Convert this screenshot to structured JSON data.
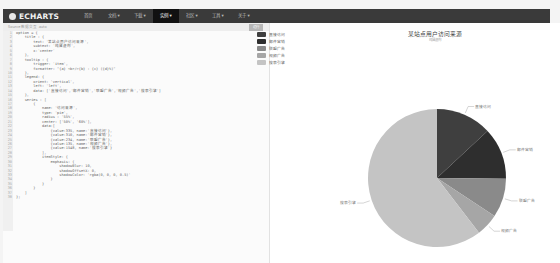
{
  "navbar": {
    "logo": "ECHARTS",
    "items": [
      {
        "label": "首页"
      },
      {
        "label": "文档 ▾"
      },
      {
        "label": "下载 ▾"
      },
      {
        "label": "实例 ▾",
        "active": true
      },
      {
        "label": "社区 ▾"
      },
      {
        "label": "工具 ▾"
      },
      {
        "label": "关于 ▾"
      }
    ]
  },
  "editor": {
    "header": "Source  数据交互  auto",
    "run_button": "运行",
    "lines": [
      "option = {",
      "    title : {",
      "        text: '某站点用户访问来源',",
      "        subtext: '纯属虚构',",
      "        x:'center'",
      "    },",
      "    tooltip : {",
      "        trigger: 'item',",
      "        formatter: \"{a} <br/>{b} : {c} ({d}%)\"",
      "    },",
      "    legend: {",
      "        orient: 'vertical',",
      "        left: 'left',",
      "        data: ['直接访问','邮件营销','联盟广告','视频广告','搜索引擎']",
      "    },",
      "    series : [",
      "        {",
      "            name: '访问来源',",
      "            type: 'pie',",
      "            radius : '55%',",
      "            center: ['50%', '60%'],",
      "            data:[",
      "                {value:335, name:'直接访问'},",
      "                {value:310, name:'邮件营销'},",
      "                {value:234, name:'联盟广告'},",
      "                {value:135, name:'视频广告'},",
      "                {value:1548, name:'搜索引擎'}",
      "            ],",
      "            itemStyle: {",
      "                emphasis: {",
      "                    shadowBlur: 10,",
      "                    shadowOffsetX: 0,",
      "                    shadowColor: 'rgba(0, 0, 0, 0.5)'",
      "                }",
      "            }",
      "        }",
      "    ]",
      "};"
    ]
  },
  "chart": {
    "title": "某站点用户访问来源",
    "subtitle": "纯属虚构",
    "legend": [
      {
        "label": "直接访问",
        "color": "#3f3f3f"
      },
      {
        "label": "邮件营销",
        "color": "#2e2e2e"
      },
      {
        "label": "联盟广告",
        "color": "#8a8a8a"
      },
      {
        "label": "视频广告",
        "color": "#a6a6a6"
      },
      {
        "label": "搜索引擎",
        "color": "#c4c4c4"
      }
    ]
  },
  "chart_data": {
    "type": "pie",
    "title": "某站点用户访问来源",
    "subtitle": "纯属虚构",
    "series_name": "访问来源",
    "categories": [
      "直接访问",
      "邮件营销",
      "联盟广告",
      "视频广告",
      "搜索引擎"
    ],
    "values": [
      335,
      310,
      234,
      135,
      1548
    ],
    "colors": [
      "#3f3f3f",
      "#2e2e2e",
      "#8a8a8a",
      "#a6a6a6",
      "#c4c4c4"
    ],
    "legend_position": "left-vertical"
  }
}
